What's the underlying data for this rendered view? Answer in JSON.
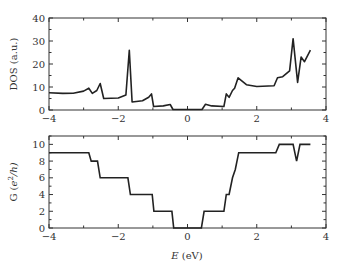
{
  "chart_data": [
    {
      "type": "line",
      "panel": "top",
      "title": "",
      "xlabel": "",
      "ylabel": "DOS (a.u.)",
      "xlim": [
        -4,
        4
      ],
      "ylim": [
        0,
        40
      ],
      "xticks": [
        -4,
        -2,
        0,
        2,
        4
      ],
      "yticks": [
        0,
        10,
        20,
        30,
        40
      ],
      "xtick_labels": [
        "−4",
        "−2",
        "0",
        "2",
        "4"
      ],
      "ytick_labels": [
        "0",
        "10",
        "20",
        "30",
        "40"
      ],
      "grid": false,
      "series": [
        {
          "name": "DOS",
          "x": [
            -4.0,
            -3.6,
            -3.3,
            -3.0,
            -2.85,
            -2.75,
            -2.62,
            -2.52,
            -2.42,
            -2.0,
            -1.78,
            -1.68,
            -1.6,
            -1.3,
            -1.12,
            -1.04,
            -0.98,
            -0.7,
            -0.5,
            -0.42,
            0.42,
            0.52,
            0.7,
            1.05,
            1.12,
            1.2,
            1.3,
            1.36,
            1.46,
            1.7,
            2.0,
            2.5,
            2.6,
            2.75,
            2.95,
            3.05,
            3.18,
            3.28,
            3.38,
            3.55
          ],
          "y": [
            7.5,
            7.2,
            7.3,
            8.2,
            9.5,
            7.2,
            8.5,
            11.5,
            5.0,
            5.2,
            6.5,
            26.0,
            3.5,
            4.0,
            5.5,
            7.0,
            1.5,
            1.8,
            2.4,
            0.2,
            0.2,
            2.5,
            1.8,
            1.5,
            7.0,
            5.5,
            8.5,
            9.5,
            14.0,
            11.0,
            10.2,
            10.5,
            14.0,
            14.5,
            17.0,
            31.0,
            12.0,
            23.0,
            21.0,
            26.0
          ]
        }
      ]
    },
    {
      "type": "line",
      "panel": "bottom",
      "title": "",
      "xlabel": "E (eV)",
      "ylabel": "G (e²/h)",
      "xlim": [
        -4,
        4
      ],
      "ylim": [
        0,
        11
      ],
      "xticks": [
        -4,
        -2,
        0,
        2,
        4
      ],
      "yticks": [
        0,
        2,
        4,
        6,
        8,
        10
      ],
      "xtick_labels": [
        "−4",
        "−2",
        "0",
        "2",
        "4"
      ],
      "ytick_labels": [
        "0",
        "2",
        "4",
        "6",
        "8",
        "10"
      ],
      "grid": false,
      "series": [
        {
          "name": "G",
          "x": [
            -4.0,
            -2.85,
            -2.78,
            -2.6,
            -2.52,
            -1.72,
            -1.65,
            -1.02,
            -0.97,
            -0.45,
            -0.4,
            0.4,
            0.48,
            1.05,
            1.12,
            1.2,
            1.3,
            1.38,
            1.48,
            2.55,
            2.65,
            3.05,
            3.15,
            3.25,
            3.55
          ],
          "y": [
            9,
            9,
            8,
            8,
            6,
            6,
            4,
            4,
            2,
            2,
            0,
            0,
            2,
            2,
            4,
            4,
            6,
            7,
            9,
            9,
            10,
            10,
            8,
            10,
            10
          ]
        }
      ]
    }
  ],
  "labels": {
    "top_ylabel": "DOS (a.u.)",
    "bottom_ylabel_main": "G (",
    "bottom_ylabel_e": "e",
    "bottom_ylabel_sup": "2",
    "bottom_ylabel_rest": "/h)",
    "xlabel_E": "E",
    "xlabel_unit": " (eV)"
  }
}
